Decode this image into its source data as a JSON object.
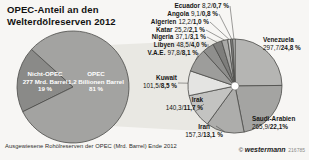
{
  "sep": "/",
  "title": {
    "line1": "OPEC-Anteil an den",
    "line2": "Welterdölreserven 2012"
  },
  "caption": "Ausgewiesene Rohölreserven der OPEC (Mrd. Barrel) Ende 2012",
  "branding": {
    "copyright": "©",
    "publisher": "westermann",
    "code": "216785"
  },
  "chart_data": [
    {
      "type": "pie",
      "name": "welterdoelreserven-2012-split",
      "title": "OPEC-Anteil an den Welterdölreserven 2012",
      "legend_position": "inside",
      "slices": [
        {
          "label": "Nicht-OPEC",
          "sub": "277 Mrd. Barrel",
          "pct": 19,
          "pct_label": "19 %",
          "color": "#8a8a88"
        },
        {
          "label": "OPEC",
          "sub": "1,2 Billionen Barrel",
          "pct": 81,
          "pct_label": "81 %",
          "color": "#a3a3a1"
        }
      ]
    },
    {
      "type": "pie",
      "name": "opec-rohoelreserven-nach-land",
      "title": "Ausgewiesene Rohölreserven der OPEC (Mrd. Barrel) Ende 2012",
      "unit": "Mrd. Barrel / Anteil in %",
      "slices": [
        {
          "label": "Venezuela",
          "value": "297,7",
          "mrd_barrel": 297.7,
          "pct": 24.8,
          "pct_label": "24,8 %",
          "color": "#b5b5b3"
        },
        {
          "label": "Saudi-Arabien",
          "value": "265,9",
          "mrd_barrel": 265.9,
          "pct": 22.1,
          "pct_label": "22,1%",
          "color": "#a4a4a2"
        },
        {
          "label": "Iran",
          "value": "157,3",
          "mrd_barrel": 157.3,
          "pct": 13.1,
          "pct_label": "13,1 %",
          "color": "#adadab"
        },
        {
          "label": "Irak",
          "value": "140,3",
          "mrd_barrel": 140.3,
          "pct": 11.7,
          "pct_label": "11,7 %",
          "color": "#c3c3c1"
        },
        {
          "label": "Kuwait",
          "value": "101,5",
          "mrd_barrel": 101.5,
          "pct": 8.5,
          "pct_label": "8,5 %",
          "color": "#e4e4e2"
        },
        {
          "label": "V.A.E.",
          "value": "97,8",
          "mrd_barrel": 97.8,
          "pct": 8.1,
          "pct_label": "8,1 %",
          "color": "#9d9d9b"
        },
        {
          "label": "Libyen",
          "value": "48,5",
          "mrd_barrel": 48.5,
          "pct": 4.0,
          "pct_label": "4,0 %",
          "color": "#8f8f8d"
        },
        {
          "label": "Nigeria",
          "value": "37,1",
          "mrd_barrel": 37.1,
          "pct": 3.1,
          "pct_label": "3,1 %",
          "color": "#7e7e7c"
        },
        {
          "label": "Katar",
          "value": "25,2",
          "mrd_barrel": 25.2,
          "pct": 2.1,
          "pct_label": "2,1 %",
          "color": "#a9a9a7"
        },
        {
          "label": "Algerien",
          "value": "12,2",
          "mrd_barrel": 12.2,
          "pct": 1.0,
          "pct_label": "1,0 %",
          "color": "#c8c8c6"
        },
        {
          "label": "Angola",
          "value": "9,1",
          "mrd_barrel": 9.1,
          "pct": 0.8,
          "pct_label": "0,8 %",
          "color": "#868684"
        },
        {
          "label": "Ecuador",
          "value": "8,2",
          "mrd_barrel": 8.2,
          "pct": 0.7,
          "pct_label": "0,7 %",
          "color": "#d4d4d2"
        }
      ]
    }
  ]
}
